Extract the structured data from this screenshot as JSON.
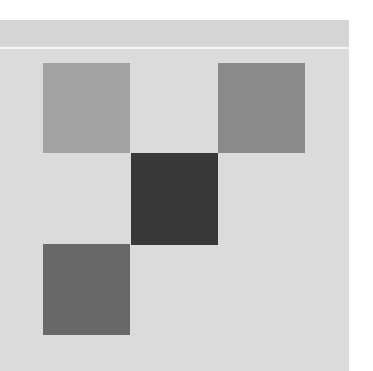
{
  "canvas": {
    "width": 373,
    "height": 371,
    "background": "#ffffff"
  },
  "panel": {
    "background": "#dbdbdb",
    "header_band_color": "#d5d5d5",
    "divider_color": "#f4f4f4"
  },
  "tiles": [
    {
      "name": "tile-top-left",
      "x": 43,
      "y": 63,
      "w": 87,
      "h": 90,
      "color": "#a3a3a3"
    },
    {
      "name": "tile-top-right",
      "x": 218,
      "y": 63,
      "w": 87,
      "h": 90,
      "color": "#8a8a8a"
    },
    {
      "name": "tile-center",
      "x": 131,
      "y": 153,
      "w": 87,
      "h": 92,
      "color": "#383838"
    },
    {
      "name": "tile-bottom-left",
      "x": 43,
      "y": 244,
      "w": 87,
      "h": 91,
      "color": "#686868"
    }
  ]
}
